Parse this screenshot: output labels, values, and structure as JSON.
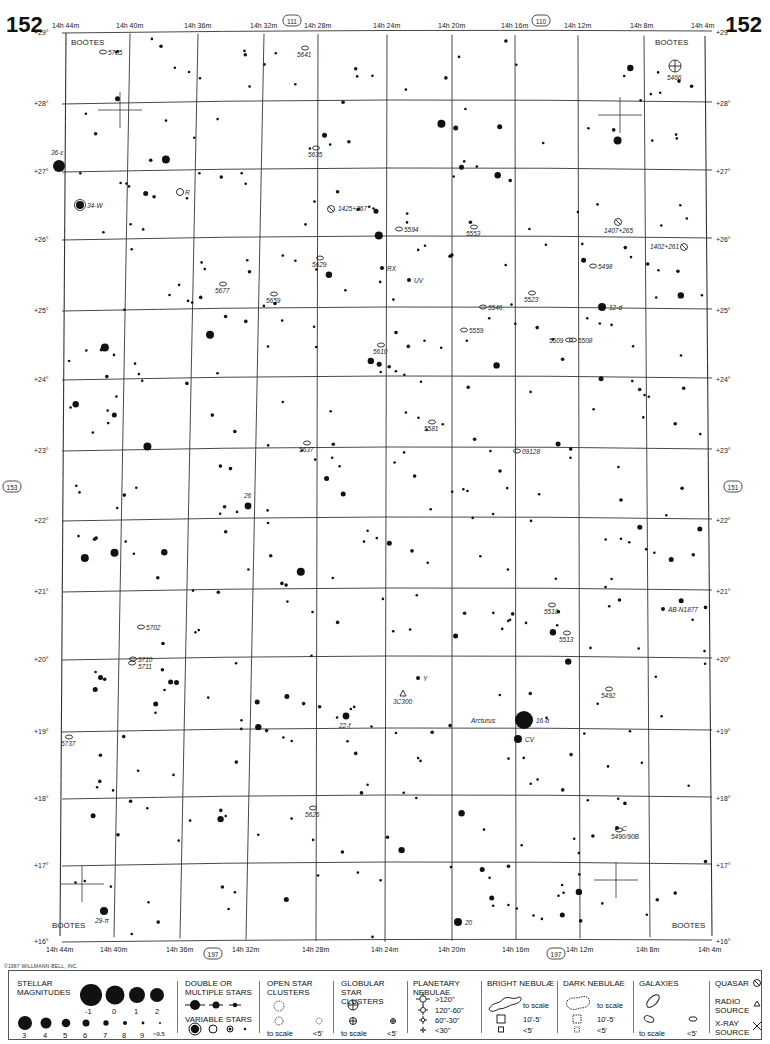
{
  "page": {
    "number_left": "152",
    "number_right": "152"
  },
  "chart_data": {
    "type": "star-chart",
    "constellation": "BOÖTES",
    "ra_labels_top": [
      "14h 44m",
      "14h 40m",
      "14h 36m",
      "14h 32m",
      "14h 28m",
      "14h 24m",
      "14h 20m",
      "14h 16m",
      "14h 12m",
      "14h 8m",
      "14h 4m"
    ],
    "ra_labels_bottom": [
      "14h 44m",
      "14h 40m",
      "14h 36m",
      "14h 32m",
      "14h 28m",
      "14h 24m",
      "14h 20m",
      "14h 16m",
      "14h 12m",
      "14h 8m",
      "14h 4m"
    ],
    "dec_labels": [
      "+29°",
      "+28°",
      "+27°",
      "+26°",
      "+25°",
      "+24°",
      "+23°",
      "+22°",
      "+21°",
      "+20°",
      "+19°",
      "+18°",
      "+17°",
      "+16°"
    ],
    "adjacent_charts": {
      "top_left": "111",
      "top_right": "110",
      "left": "153",
      "right": "151",
      "bottom_left": "197",
      "bottom_right": "197"
    },
    "constellation_labels": [
      "BOÖTES",
      "BOÖTES",
      "BOÖTES",
      "BOÖTES"
    ],
    "named_stars": [
      {
        "label": "36-ε",
        "x": 59,
        "y": 166,
        "mag": 2
      },
      {
        "label": "34-W",
        "x": 80,
        "y": 205,
        "mag": 4,
        "variable": true
      },
      {
        "label": "R",
        "x": 180,
        "y": 192,
        "variable": true
      },
      {
        "label": "12-d",
        "x": 602,
        "y": 307,
        "mag": 4
      },
      {
        "label": "26",
        "x": 248,
        "y": 506,
        "mag": 5
      },
      {
        "label": "22-f",
        "x": 346,
        "y": 716,
        "mag": 5
      },
      {
        "label": "Arcturus 16-α",
        "x": 524,
        "y": 720,
        "mag": -1
      },
      {
        "label": "CV",
        "x": 518,
        "y": 739,
        "mag": 4
      },
      {
        "label": "29-π",
        "x": 104,
        "y": 911,
        "mag": 4
      },
      {
        "label": "20",
        "x": 458,
        "y": 922,
        "mag": 4
      },
      {
        "label": "Y",
        "x": 418,
        "y": 678
      },
      {
        "label": "UV",
        "x": 409,
        "y": 280
      },
      {
        "label": "RX",
        "x": 382,
        "y": 268
      },
      {
        "label": "AB-N1877",
        "x": 663,
        "y": 609
      },
      {
        "label": "C",
        "x": 617,
        "y": 828
      }
    ],
    "galaxies": [
      "5735",
      "5641",
      "5635",
      "5594",
      "5553",
      "5629",
      "5677",
      "5659",
      "5546",
      "5523",
      "5498",
      "5559",
      "5610",
      "5509",
      "5508",
      "5581",
      "5637",
      "09128",
      "5702",
      "5710",
      "5711",
      "5518",
      "5513",
      "5492",
      "5737",
      "5626",
      "5490/90B"
    ],
    "globular_clusters": [
      "5466"
    ],
    "quasars": [
      "1425+267",
      "1407+265",
      "1402+261"
    ],
    "radio_sources": [
      "3C300"
    ]
  },
  "copyright": "©1987 WILLMANN-BELL, INC.",
  "legend": {
    "stellar_magnitudes": {
      "title": "STELLAR MAGNITUDES",
      "row1": [
        "-1",
        "0",
        "1",
        "2"
      ],
      "row2": [
        "3",
        "4",
        "5",
        "6",
        "7",
        "8",
        "9",
        ">9.5"
      ]
    },
    "double_stars": {
      "title": "DOUBLE OR MULTIPLE STARS"
    },
    "variable_stars": {
      "title": "VARIABLE STARS"
    },
    "open_clusters": {
      "title": "OPEN STAR CLUSTERS",
      "to_scale": "to scale",
      "small": "<5'"
    },
    "globular_clusters": {
      "title": "GLOBULAR STAR CLUSTERS",
      "to_scale": "to scale",
      "small": "<5'"
    },
    "planetary_nebulae": {
      "title": "PLANETARY NEBULAE",
      "sizes": [
        ">120\"",
        "120\"-60\"",
        "60\"-30\"",
        "<30\""
      ]
    },
    "bright_nebulae": {
      "title": "BRIGHT NEBULÆ",
      "sizes": [
        "to scale",
        "10'-5'",
        "<5'"
      ]
    },
    "dark_nebulae": {
      "title": "DARK NEBULAE",
      "sizes": [
        "to scale",
        "10'-5'",
        "<5'"
      ]
    },
    "galaxies": {
      "title": "GALAXIES",
      "to_scale": "to scale",
      "small": "<5'"
    },
    "quasar": {
      "title": "QUASAR"
    },
    "radio_source": {
      "title": "RADIO SOURCE"
    },
    "xray_source": {
      "title": "X-RAY SOURCE"
    }
  }
}
